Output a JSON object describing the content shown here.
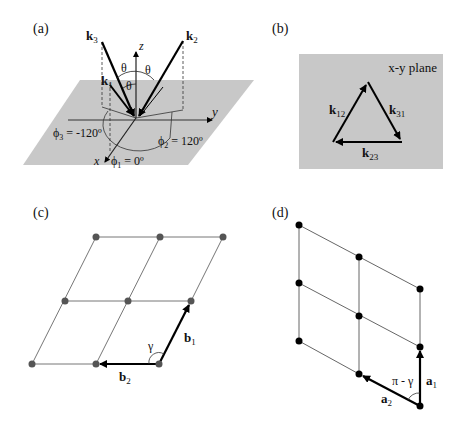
{
  "panels": {
    "a": {
      "label": "(a)",
      "vectors": [
        "k",
        "k",
        "k"
      ],
      "vector_subs": [
        "1",
        "2",
        "3"
      ],
      "axes": {
        "x": "x",
        "y": "y",
        "z": "z"
      },
      "angle": "θ",
      "phi_symbol": "ϕ",
      "phi1": {
        "sub": "1",
        "value": " = 0º"
      },
      "phi2": {
        "sub": "2",
        "value": " = 120º"
      },
      "phi3": {
        "sub": "3",
        "value": " = -120º"
      },
      "plane_color": "#c8c8c8"
    },
    "b": {
      "label": "(b)",
      "plane_label": "x-y plane",
      "vec": "k",
      "subs": {
        "k12": "12",
        "k31": "31",
        "k23": "23"
      },
      "plane_color": "#c8c8c8"
    },
    "c": {
      "label": "(c)",
      "b1": "b",
      "b1_sub": "1",
      "b2": "b",
      "b2_sub": "2",
      "angle": "γ",
      "dot_color": "#555555"
    },
    "d": {
      "label": "(d)",
      "a1": "a",
      "a1_sub": "1",
      "a2": "a",
      "a2_sub": "2",
      "angle": "π - γ",
      "dot_color": "#000000"
    }
  }
}
